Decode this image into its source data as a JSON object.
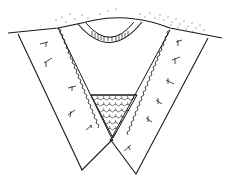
{
  "diagram": {
    "type": "weld-cross-section",
    "description": "V-groove weld cross-section line drawing",
    "colors": {
      "background": "#ffffff",
      "line": "#1a1a1a"
    },
    "parts": [
      {
        "id": "surface",
        "label": ""
      },
      {
        "id": "left-plate",
        "label": ""
      },
      {
        "id": "right-plate",
        "label": ""
      },
      {
        "id": "weld-cap",
        "label": ""
      },
      {
        "id": "fill-region",
        "label": ""
      },
      {
        "id": "root-pass",
        "label": ""
      }
    ]
  }
}
